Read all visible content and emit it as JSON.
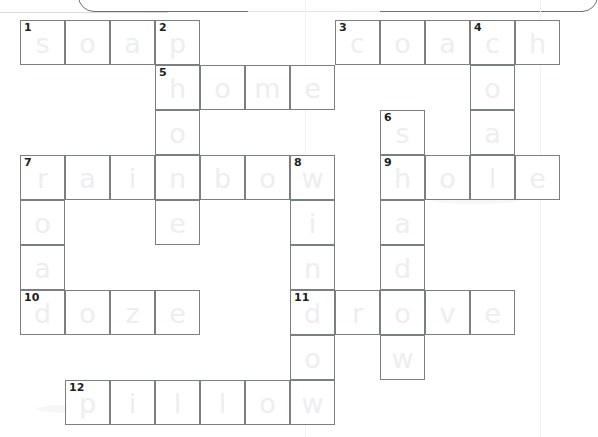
{
  "puzzle": {
    "title": "Crossword Puzzle",
    "type": "crossword",
    "cell_size": 45,
    "origin": {
      "x": 20,
      "y": 20
    },
    "columns": 12,
    "rows": 9,
    "letter_color": "#eceef0",
    "grid_line_color": "#7a7f81",
    "number_color": "#1c1f21",
    "background_color": "#ffffff"
  },
  "entries": {
    "across": [
      {
        "number": "1",
        "answer": "soap",
        "row": 0,
        "col": 0
      },
      {
        "number": "3",
        "answer": "coach",
        "row": 0,
        "col": 7
      },
      {
        "number": "5",
        "answer": "home",
        "row": 1,
        "col": 3
      },
      {
        "number": "7",
        "answer": "rainbow",
        "row": 3,
        "col": 0
      },
      {
        "number": "9",
        "answer": "hole",
        "row": 3,
        "col": 8
      },
      {
        "number": "10",
        "answer": "doze",
        "row": 6,
        "col": 0
      },
      {
        "number": "11",
        "answer": "drove",
        "row": 6,
        "col": 6
      },
      {
        "number": "12",
        "answer": "pillow",
        "row": 8,
        "col": 1
      }
    ],
    "down": [
      {
        "number": "1",
        "answer": "s",
        "row": 0,
        "col": 0
      },
      {
        "number": "2",
        "answer": "phone",
        "row": 0,
        "col": 3
      },
      {
        "number": "4",
        "answer": "coal",
        "row": 0,
        "col": 10
      },
      {
        "number": "6",
        "answer": "shadow",
        "row": 2,
        "col": 8
      },
      {
        "number": "7",
        "answer": "road",
        "row": 3,
        "col": 0
      },
      {
        "number": "8",
        "answer": "window",
        "row": 3,
        "col": 6
      }
    ]
  },
  "cells": [
    {
      "id": "c-r0-0",
      "row": 0,
      "col": 0,
      "letter": "s",
      "number": "1"
    },
    {
      "id": "c-r0-1",
      "row": 0,
      "col": 1,
      "letter": "o",
      "number": ""
    },
    {
      "id": "c-r0-2",
      "row": 0,
      "col": 2,
      "letter": "a",
      "number": ""
    },
    {
      "id": "c-r0-3",
      "row": 0,
      "col": 3,
      "letter": "p",
      "number": "2"
    },
    {
      "id": "c-r0-7",
      "row": 0,
      "col": 7,
      "letter": "c",
      "number": "3"
    },
    {
      "id": "c-r0-8",
      "row": 0,
      "col": 8,
      "letter": "o",
      "number": ""
    },
    {
      "id": "c-r0-9",
      "row": 0,
      "col": 9,
      "letter": "a",
      "number": ""
    },
    {
      "id": "c-r0-10",
      "row": 0,
      "col": 10,
      "letter": "c",
      "number": "4"
    },
    {
      "id": "c-r0-11",
      "row": 0,
      "col": 11,
      "letter": "h",
      "number": ""
    },
    {
      "id": "c-r1-3",
      "row": 1,
      "col": 3,
      "letter": "h",
      "number": "5"
    },
    {
      "id": "c-r1-4",
      "row": 1,
      "col": 4,
      "letter": "o",
      "number": ""
    },
    {
      "id": "c-r1-5",
      "row": 1,
      "col": 5,
      "letter": "m",
      "number": ""
    },
    {
      "id": "c-r1-6",
      "row": 1,
      "col": 6,
      "letter": "e",
      "number": ""
    },
    {
      "id": "c-r1-10",
      "row": 1,
      "col": 10,
      "letter": "o",
      "number": ""
    },
    {
      "id": "c-r2-3",
      "row": 2,
      "col": 3,
      "letter": "o",
      "number": ""
    },
    {
      "id": "c-r2-8",
      "row": 2,
      "col": 8,
      "letter": "s",
      "number": "6"
    },
    {
      "id": "c-r2-10",
      "row": 2,
      "col": 10,
      "letter": "a",
      "number": ""
    },
    {
      "id": "c-r3-0",
      "row": 3,
      "col": 0,
      "letter": "r",
      "number": "7"
    },
    {
      "id": "c-r3-1",
      "row": 3,
      "col": 1,
      "letter": "a",
      "number": ""
    },
    {
      "id": "c-r3-2",
      "row": 3,
      "col": 2,
      "letter": "i",
      "number": ""
    },
    {
      "id": "c-r3-3",
      "row": 3,
      "col": 3,
      "letter": "n",
      "number": ""
    },
    {
      "id": "c-r3-4",
      "row": 3,
      "col": 4,
      "letter": "b",
      "number": ""
    },
    {
      "id": "c-r3-5",
      "row": 3,
      "col": 5,
      "letter": "o",
      "number": ""
    },
    {
      "id": "c-r3-6",
      "row": 3,
      "col": 6,
      "letter": "w",
      "number": "8"
    },
    {
      "id": "c-r3-8",
      "row": 3,
      "col": 8,
      "letter": "h",
      "number": "9"
    },
    {
      "id": "c-r3-9",
      "row": 3,
      "col": 9,
      "letter": "o",
      "number": ""
    },
    {
      "id": "c-r3-10",
      "row": 3,
      "col": 10,
      "letter": "l",
      "number": ""
    },
    {
      "id": "c-r3-11",
      "row": 3,
      "col": 11,
      "letter": "e",
      "number": ""
    },
    {
      "id": "c-r4-0",
      "row": 4,
      "col": 0,
      "letter": "o",
      "number": ""
    },
    {
      "id": "c-r4-3",
      "row": 4,
      "col": 3,
      "letter": "e",
      "number": ""
    },
    {
      "id": "c-r4-6",
      "row": 4,
      "col": 6,
      "letter": "i",
      "number": ""
    },
    {
      "id": "c-r4-8",
      "row": 4,
      "col": 8,
      "letter": "a",
      "number": ""
    },
    {
      "id": "c-r5-0",
      "row": 5,
      "col": 0,
      "letter": "a",
      "number": ""
    },
    {
      "id": "c-r5-6",
      "row": 5,
      "col": 6,
      "letter": "n",
      "number": ""
    },
    {
      "id": "c-r5-8",
      "row": 5,
      "col": 8,
      "letter": "d",
      "number": ""
    },
    {
      "id": "c-r6-0",
      "row": 6,
      "col": 0,
      "letter": "d",
      "number": "10"
    },
    {
      "id": "c-r6-1",
      "row": 6,
      "col": 1,
      "letter": "o",
      "number": ""
    },
    {
      "id": "c-r6-2",
      "row": 6,
      "col": 2,
      "letter": "z",
      "number": ""
    },
    {
      "id": "c-r6-3",
      "row": 6,
      "col": 3,
      "letter": "e",
      "number": ""
    },
    {
      "id": "c-r6-6",
      "row": 6,
      "col": 6,
      "letter": "d",
      "number": "11"
    },
    {
      "id": "c-r6-7",
      "row": 6,
      "col": 7,
      "letter": "r",
      "number": ""
    },
    {
      "id": "c-r6-8",
      "row": 6,
      "col": 8,
      "letter": "o",
      "number": ""
    },
    {
      "id": "c-r6-9",
      "row": 6,
      "col": 9,
      "letter": "v",
      "number": ""
    },
    {
      "id": "c-r6-10",
      "row": 6,
      "col": 10,
      "letter": "e",
      "number": ""
    },
    {
      "id": "c-r7-6",
      "row": 7,
      "col": 6,
      "letter": "o",
      "number": ""
    },
    {
      "id": "c-r7-8",
      "row": 7,
      "col": 8,
      "letter": "w",
      "number": ""
    },
    {
      "id": "c-r8-1",
      "row": 8,
      "col": 1,
      "letter": "p",
      "number": "12"
    },
    {
      "id": "c-r8-2",
      "row": 8,
      "col": 2,
      "letter": "i",
      "number": ""
    },
    {
      "id": "c-r8-3",
      "row": 8,
      "col": 3,
      "letter": "l",
      "number": ""
    },
    {
      "id": "c-r8-4",
      "row": 8,
      "col": 4,
      "letter": "l",
      "number": ""
    },
    {
      "id": "c-r8-5",
      "row": 8,
      "col": 5,
      "letter": "o",
      "number": ""
    },
    {
      "id": "c-r8-6",
      "row": 8,
      "col": 6,
      "letter": "w",
      "number": ""
    }
  ]
}
